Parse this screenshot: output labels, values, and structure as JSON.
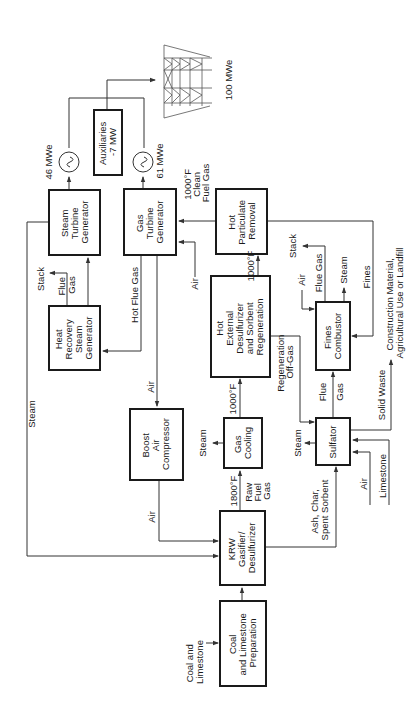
{
  "diagram": {
    "orientation": "rotated 90 degrees counter-clockwise",
    "blocks": {
      "coal_prep": [
        "Coal",
        "and Limestone",
        "Preparation"
      ],
      "gasifier": [
        "KRW",
        "Gasifier/",
        "Desulfurizer"
      ],
      "boost_compressor": [
        "Boost",
        "Air",
        "Compressor"
      ],
      "gas_cooling": [
        "Gas",
        "Cooling"
      ],
      "sulfator": [
        "Sulfator"
      ],
      "hot_desulfurizer": [
        "Hot",
        "External",
        "Desulfurizer",
        "and Sorbent",
        "Regeneration"
      ],
      "fines_combustor": [
        "Fines",
        "Combustor"
      ],
      "hrsg": [
        "Heat",
        "Recovery",
        "Steam",
        "Generator"
      ],
      "gas_turbine": [
        "Gas",
        "Turbine",
        "Generator"
      ],
      "steam_turbine": [
        "Steam",
        "Turbine",
        "Generator"
      ],
      "hot_particulate": [
        "Hot",
        "Particulate",
        "Removal"
      ],
      "auxiliaries": [
        "Auxiliaries",
        "-7 MW"
      ]
    },
    "labels": {
      "coal_limestone_in": [
        "Coal and",
        "Limestone"
      ],
      "air_to_gasifier": "Air",
      "steam_main": "Steam",
      "air_from_gt": "Air",
      "raw_fuel": [
        "1800°F",
        "Raw",
        "Fuel",
        "Gas"
      ],
      "gas_cooling_steam": "Steam",
      "t1000_a": "1000°F",
      "t1000_b": "1000°F",
      "clean_fuel": [
        "1000°F",
        "Clean",
        "Fuel Gas"
      ],
      "air_gt": "Air",
      "hot_flue_gas": "Hot Flue Gas",
      "hrsg_flue": [
        "Flue",
        "Gas"
      ],
      "hrsg_stack": "Stack",
      "regen_offgas": [
        "Regeneration",
        "Off-Gas"
      ],
      "sulfator_steam": "Steam",
      "sulfator_flue": [
        "Flue",
        "Gas"
      ],
      "ash_char": [
        "Ash, Char,",
        "Spent Sorbent"
      ],
      "sulfator_air": "Air",
      "limestone": "Limestone",
      "solid_waste": "Solid Waste",
      "fc_air": "Air",
      "fc_flue": "Flue Gas",
      "fc_stack": "Stack",
      "fc_steam": "Steam",
      "fines": "Fines",
      "disposal": [
        "Construction Material,",
        "Agricultural Use or Landfill"
      ],
      "st_output": "46 MWe",
      "gt_output": "61 MWe",
      "net_output": "100 MWe"
    }
  }
}
